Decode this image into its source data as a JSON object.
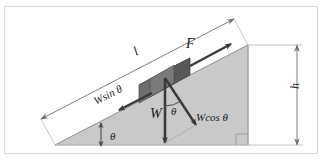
{
  "figure": {
    "clipped_caption": "—  —  —  —",
    "background_color": "#ffffff",
    "frame_border_color": "#d8d8d8",
    "incline_fill_color": "#c9c9c9",
    "incline_edge_color": "#9a9a9a",
    "block_color_top": "#8f8f8f",
    "block_color_front": "#6e6e6e",
    "block_color_side": "#4a4a4a",
    "vector_color": "#3a3a3a",
    "dimension_color": "#8a8a8a"
  },
  "labels": {
    "incline_length": "l",
    "applied_force": "F",
    "weight_component_parallel": "Wsin θ",
    "weight": "W",
    "weight_component_perpendicular": "Wcos θ",
    "height": "h",
    "angle_at_block": "θ",
    "angle_at_base": "θ"
  },
  "vectors": [
    {
      "name": "applied-force",
      "label": "F",
      "direction": "up-slope",
      "origin": "block"
    },
    {
      "name": "weight",
      "label": "W",
      "direction": "vertically-down",
      "origin": "block"
    },
    {
      "name": "weight-parallel",
      "label": "Wsin θ",
      "direction": "down-slope",
      "origin": "block"
    },
    {
      "name": "weight-perpendicular",
      "label": "Wcos θ",
      "direction": "perpendicular-into-slope",
      "origin": "block"
    }
  ],
  "dimensions": [
    {
      "name": "slope-length",
      "label": "l",
      "style": "double-headed-arrow",
      "orientation": "parallel-to-slope"
    },
    {
      "name": "vertical-height",
      "label": "h",
      "style": "double-headed-arrow",
      "orientation": "vertical"
    }
  ],
  "angles": [
    {
      "name": "base-angle",
      "label": "θ",
      "location": "bottom-left-of-incline"
    },
    {
      "name": "block-angle",
      "label": "θ",
      "location": "between-weight-and-perpendicular-component"
    }
  ]
}
